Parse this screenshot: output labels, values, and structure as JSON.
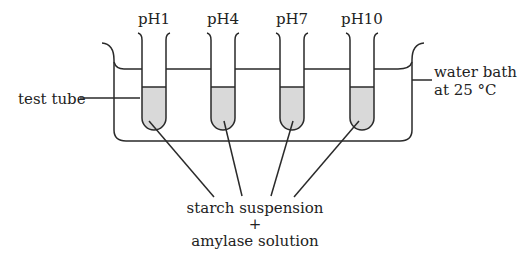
{
  "diagram": {
    "tubes": [
      {
        "label": "pH1",
        "cx": 154
      },
      {
        "label": "pH4",
        "cx": 223
      },
      {
        "label": "pH7",
        "cx": 292
      },
      {
        "label": "pH10",
        "cx": 362
      }
    ],
    "labels": {
      "test_tube": "test tube",
      "water_bath_line1": "water bath",
      "water_bath_line2": "at 25 °C",
      "contents_line1": "starch suspension",
      "contents_plus": "+",
      "contents_line2": "amylase solution"
    },
    "colors": {
      "stroke": "#2a2a2a",
      "liquid": "#d9d9d9",
      "background": "#ffffff"
    }
  }
}
